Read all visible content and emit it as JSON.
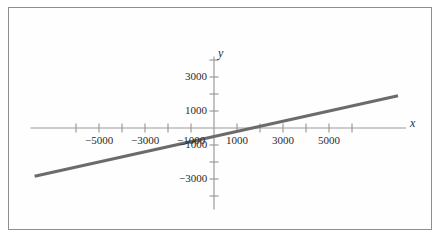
{
  "figure": {
    "background_color": "#ffffff",
    "frame_color": "#8e8e8e",
    "axis_color": "#9a9a9a",
    "line_color": "#6b6b6b",
    "text_color": "#2b2b2b"
  },
  "chart_data": {
    "type": "line",
    "title": "",
    "subtitle": "",
    "xlabel": "x",
    "ylabel": "y",
    "grid": false,
    "legend": null,
    "xlim": [
      -7800,
      8000
    ],
    "ylim": [
      -4800,
      4200
    ],
    "x_major_ticks": [
      -5000,
      -3000,
      -1000,
      1000,
      3000,
      5000
    ],
    "x_minor_ticks": [
      -6000,
      -4000,
      -2000,
      2000,
      4000,
      6000
    ],
    "x_tick_labels": [
      "−5000",
      "−3000",
      "−1000",
      "1000",
      "3000",
      "5000"
    ],
    "y_major_ticks": [
      3000,
      1000,
      -1000,
      -3000
    ],
    "y_minor_ticks": [
      4000,
      2000,
      -2000,
      -4000
    ],
    "y_tick_labels": [
      "3000",
      "1000",
      "−1000",
      "−3000"
    ],
    "series": [
      {
        "name": "line",
        "slope": 0.3,
        "intercept": -500,
        "x_intercept": 1667,
        "points": [
          {
            "x": -7800,
            "y": -2840
          },
          {
            "x": 8000,
            "y": 1900
          }
        ]
      }
    ]
  }
}
